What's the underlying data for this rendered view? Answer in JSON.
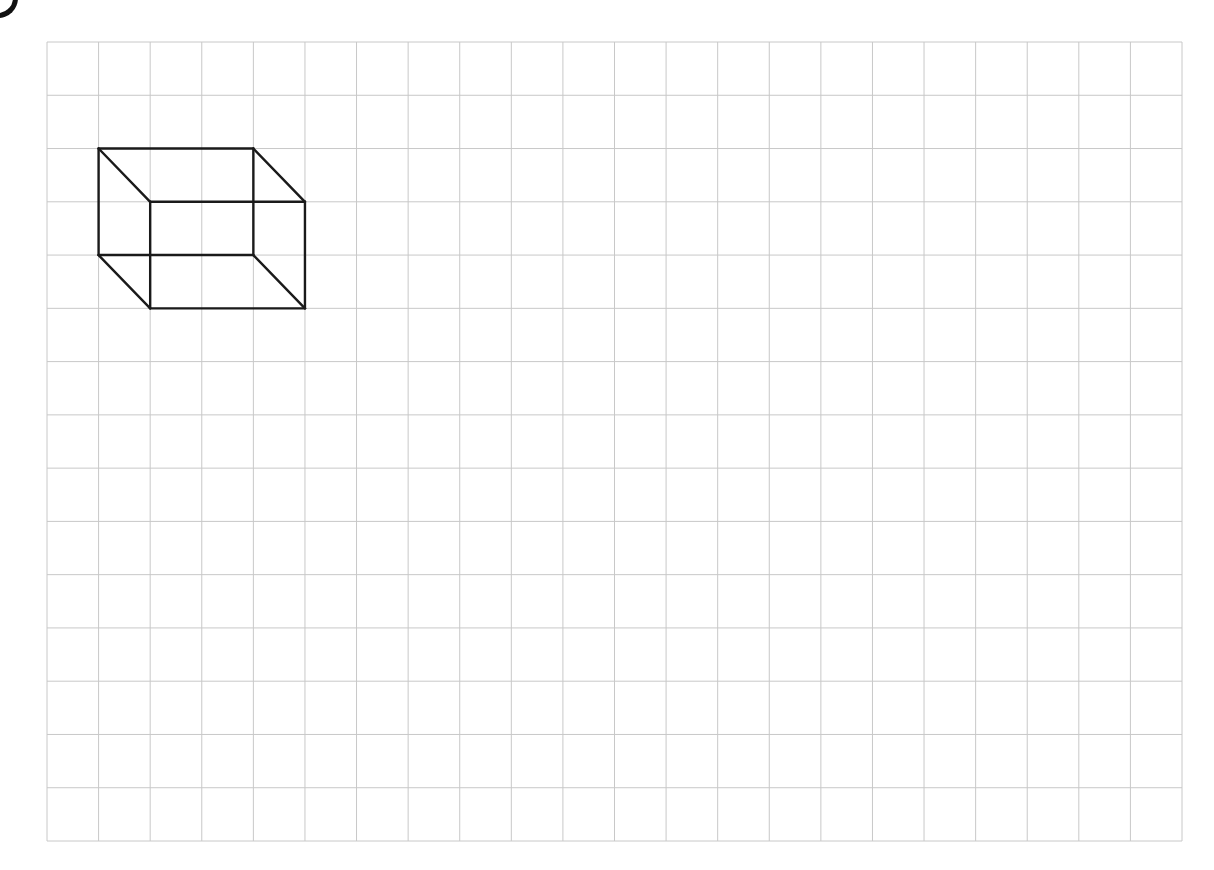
{
  "grid": {
    "columns": 22,
    "rows": 15,
    "left": 47,
    "top": 42,
    "right": 1182,
    "bottom": 841,
    "line_color": "#c8c8c8"
  },
  "shape": {
    "type": "cuboid-wireframe",
    "stroke_color": "#1a1a1a",
    "stroke_width": 2.4,
    "back_face": {
      "col_start": 1,
      "row_start": 2,
      "col_end": 4,
      "row_end": 4
    },
    "front_face": {
      "col_start": 2,
      "row_start": 3,
      "col_end": 5,
      "row_end": 5
    },
    "dimensions_in_cells": {
      "width": 3,
      "height": 2,
      "depth_offset": [
        1,
        1
      ]
    }
  },
  "corner_mark": {
    "color": "#111111"
  }
}
